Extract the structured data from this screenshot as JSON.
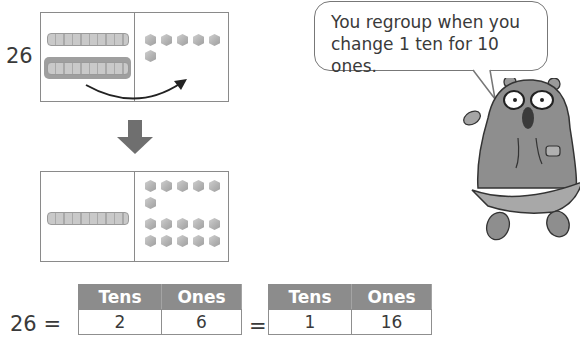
{
  "top_model": {
    "number_label": "26",
    "tens_rods": 2,
    "ones_cubes": 6,
    "highlighted_rod": "second ten rod (moved to ones)",
    "arrow": "curved arrow from tens to ones"
  },
  "down_arrow": "down-arrow",
  "bottom_model": {
    "tens_rods": 1,
    "ones_cubes": 16,
    "cube_rows": [
      5,
      1,
      5,
      5
    ]
  },
  "speech_bubble": {
    "line1": "You regroup when you",
    "line2": "change 1 ten for 10 ones."
  },
  "character": "bear with glasses and hoodie",
  "equation": {
    "lhs": "26 =",
    "table1": {
      "headers": [
        "Tens",
        "Ones"
      ],
      "values": [
        "2",
        "6"
      ]
    },
    "equals": "=",
    "table2": {
      "headers": [
        "Tens",
        "Ones"
      ],
      "values": [
        "1",
        "16"
      ]
    }
  },
  "colors": {
    "header_fill": "#8c8c8c",
    "border": "#8a8a8a",
    "text": "#3a3a3a"
  }
}
